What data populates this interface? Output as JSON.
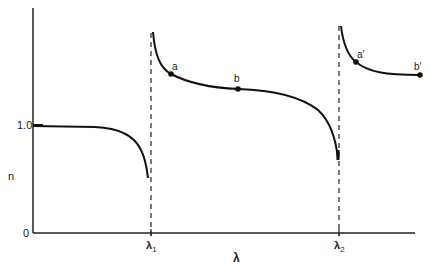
{
  "figure": {
    "type": "dispersion-curve-diagram"
  },
  "axes": {
    "y_label": "n",
    "x_label": "λ",
    "y_ticks": [
      {
        "label": "1.0",
        "value": 1.0
      },
      {
        "label": "0",
        "value": 0
      }
    ],
    "x_ticks": [
      {
        "label": "λ",
        "sub": "1"
      },
      {
        "label": "λ",
        "sub": "2"
      }
    ]
  },
  "points": {
    "a": "a",
    "b": "b",
    "a_prime": "a′",
    "b_prime": "b′"
  },
  "colors": {
    "curve": "#111111",
    "axis": "#222222",
    "background": "#ffffff"
  }
}
